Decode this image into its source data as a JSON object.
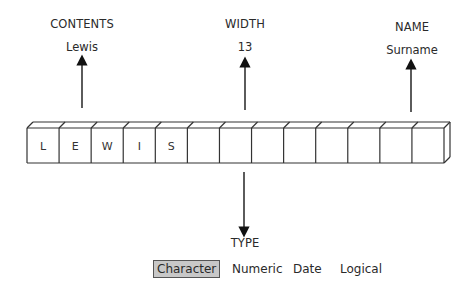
{
  "diagram": {
    "contents": {
      "heading": "CONTENTS",
      "value": "Lewis"
    },
    "width": {
      "heading": "WIDTH",
      "value": "13"
    },
    "name": {
      "heading": "NAME",
      "value": "Surname"
    },
    "field": {
      "cell_count": 13,
      "letters": [
        "L",
        "E",
        "W",
        "I",
        "S"
      ]
    },
    "type": {
      "heading": "TYPE",
      "options": [
        {
          "label": "Character",
          "selected": true
        },
        {
          "label": "Numeric",
          "selected": false
        },
        {
          "label": "Date",
          "selected": false
        },
        {
          "label": "Logical",
          "selected": false
        }
      ]
    }
  }
}
